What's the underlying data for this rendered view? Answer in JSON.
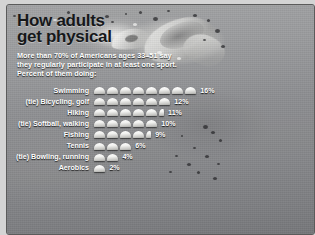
{
  "title": "How adults\nget physical",
  "subtitle": "More than 70% of Americans ages 33–51 say they regularly participate in at least one sport. Percent of them doing:",
  "chart_data": {
    "type": "bar",
    "title": "How adults get physical",
    "subtitle": "More than 70% of Americans ages 33–51 say they regularly participate in at least one sport. Percent of them doing:",
    "xlabel": "",
    "ylabel": "",
    "unit": "%",
    "pictogram_unit_value": 2,
    "grid": false,
    "legend": "none",
    "xlim": [
      0,
      16
    ],
    "categories": [
      "Swimming",
      "(tie) Bicycling, golf",
      "Hiking",
      "(tie) Softball, walking",
      "Fishing",
      "Tennis",
      "(tie) Bowling, running",
      "Aerobics"
    ],
    "values": [
      16,
      12,
      11,
      10,
      9,
      6,
      4,
      2
    ],
    "value_labels": [
      "16%",
      "12%",
      "11%",
      "10%",
      "9%",
      "6%",
      "4%",
      "2%"
    ],
    "rows": [
      {
        "label": "Swimming",
        "value": 16,
        "value_label": "16%",
        "full_units": 8,
        "half_unit": false
      },
      {
        "label": "(tie) Bicycling, golf",
        "value": 12,
        "value_label": "12%",
        "full_units": 6,
        "half_unit": false
      },
      {
        "label": "Hiking",
        "value": 11,
        "value_label": "11%",
        "full_units": 5,
        "half_unit": true
      },
      {
        "label": "(tie) Softball, walking",
        "value": 10,
        "value_label": "10%",
        "full_units": 5,
        "half_unit": false
      },
      {
        "label": "Fishing",
        "value": 9,
        "value_label": "9%",
        "full_units": 4,
        "half_unit": true
      },
      {
        "label": "Tennis",
        "value": 6,
        "value_label": "6%",
        "full_units": 3,
        "half_unit": false
      },
      {
        "label": "(tie) Bowling, running",
        "value": 4,
        "value_label": "4%",
        "full_units": 2,
        "half_unit": false
      },
      {
        "label": "Aerobics",
        "value": 2,
        "value_label": "2%",
        "full_units": 1,
        "half_unit": false
      }
    ]
  },
  "background": {
    "image_description": "grayscale photo of a swimmer stroking through water with splashing droplets",
    "icon": "swim-cap-icon"
  },
  "colors": {
    "text_light": "#ffffff",
    "title_dark": "#16181a",
    "frame": "#5b5b5b",
    "page": "#d4d4d4"
  }
}
